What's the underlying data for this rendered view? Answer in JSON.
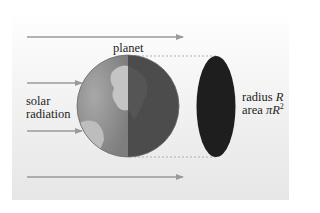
{
  "diagram": {
    "title_label": "planet",
    "left_label_line1": "solar",
    "left_label_line2": "radiation",
    "right_label": {
      "radius_prefix": "radius",
      "radius_symbol": "R",
      "area_prefix": "area",
      "area_symbol": "πR",
      "area_exponent": "2"
    },
    "arrows": [
      {
        "name": "top",
        "y": 37,
        "x1": 27,
        "x2": 183
      },
      {
        "name": "upper-middle",
        "y": 83,
        "x1": 27,
        "x2": 82
      },
      {
        "name": "lower-middle",
        "y": 131,
        "x1": 27,
        "x2": 82
      },
      {
        "name": "bottom",
        "y": 177,
        "x1": 27,
        "x2": 183
      }
    ],
    "colors": {
      "arrow": "#9a9a9a",
      "planet_day": "#8f8f8f",
      "planet_night": "#4a4a4a",
      "shadow_disk": "#1e1e1e",
      "text": "#231f20",
      "dashed": "#b0b0b0"
    }
  }
}
